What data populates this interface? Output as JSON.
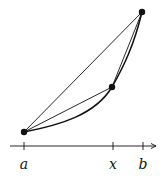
{
  "diagram": {
    "colors": {
      "stroke": "#111111",
      "background": "#ffffff"
    },
    "points": {
      "a": {
        "cx": 24,
        "cy": 132
      },
      "x": {
        "cx": 112,
        "cy": 87
      },
      "b": {
        "cx": 142,
        "cy": 12
      }
    },
    "axis": {
      "y": 146,
      "x_start": 10,
      "x_end": 157,
      "ticks": [
        {
          "x": 24,
          "label": "a"
        },
        {
          "x": 113,
          "label": "x"
        },
        {
          "x": 143,
          "label": "b"
        }
      ]
    }
  }
}
